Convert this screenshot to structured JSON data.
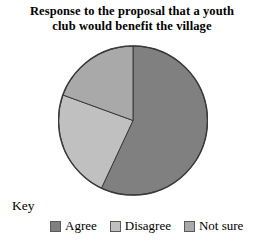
{
  "chart_data": {
    "type": "pie",
    "title": "Response to the proposal that a youth club would benefit the village",
    "title_line1": "Response to the proposal that a youth",
    "title_line2": "club would benefit the village",
    "categories": [
      "Agree",
      "Disagree",
      "Not sure"
    ],
    "values": [
      57,
      24,
      19
    ],
    "units": "percent",
    "start_angle_deg": 0,
    "direction": "clockwise",
    "slice_angles_deg": [
      205,
      85,
      70
    ],
    "colors": [
      "#808080",
      "#c0c0c0",
      "#a9a9a9"
    ],
    "stroke_color": "#3a3a3a",
    "legend_position": "bottom",
    "legend_title": "Key",
    "xlabel": "",
    "ylabel": "",
    "grid": false,
    "data_labels": false
  },
  "legend": {
    "title": "Key",
    "items": [
      {
        "label": "Agree",
        "color": "#808080"
      },
      {
        "label": "Disagree",
        "color": "#c0c0c0"
      },
      {
        "label": "Not sure",
        "color": "#a9a9a9"
      }
    ]
  }
}
